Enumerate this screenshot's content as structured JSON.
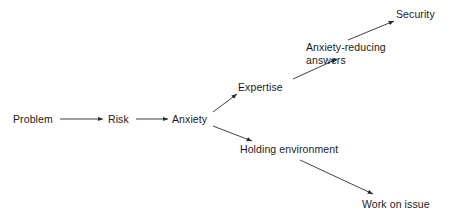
{
  "diagram": {
    "type": "flowchart",
    "canvas": {
      "width": 453,
      "height": 219
    },
    "stroke_color": "#2b2b2b",
    "text_color": "#1a1a1a",
    "background_color": "#ffffff",
    "nodes": [
      {
        "id": "problem",
        "label": "Problem",
        "x": 13,
        "y": 113
      },
      {
        "id": "risk",
        "label": "Risk",
        "x": 108,
        "y": 113
      },
      {
        "id": "anxiety",
        "label": "Anxiety",
        "x": 172,
        "y": 113
      },
      {
        "id": "expertise",
        "label": "Expertise",
        "x": 238,
        "y": 81
      },
      {
        "id": "anxiety-reducing-answers",
        "label": "Anxiety-reducing\nanswers",
        "x": 306,
        "y": 41
      },
      {
        "id": "security",
        "label": "Security",
        "x": 396,
        "y": 8
      },
      {
        "id": "holding-environment",
        "label": "Holding environment",
        "x": 240,
        "y": 143
      },
      {
        "id": "work-on-issue",
        "label": "Work on issue",
        "x": 362,
        "y": 198
      }
    ],
    "edges": [
      {
        "id": "problem-to-risk",
        "from": "problem",
        "to": "risk",
        "x1": 60,
        "y1": 119,
        "x2": 103,
        "y2": 119
      },
      {
        "id": "risk-to-anxiety",
        "from": "risk",
        "to": "anxiety",
        "x1": 136,
        "y1": 119,
        "x2": 168,
        "y2": 119
      },
      {
        "id": "anxiety-to-expertise",
        "from": "anxiety",
        "to": "expertise",
        "x1": 213,
        "y1": 112,
        "x2": 237,
        "y2": 94
      },
      {
        "id": "expertise-to-answers",
        "from": "expertise",
        "to": "anxiety-reducing-answers",
        "x1": 293,
        "y1": 79,
        "x2": 337,
        "y2": 59
      },
      {
        "id": "answers-to-security",
        "from": "anxiety-reducing-answers",
        "to": "security",
        "x1": 348,
        "y1": 40,
        "x2": 394,
        "y2": 21
      },
      {
        "id": "anxiety-to-holding",
        "from": "anxiety",
        "to": "holding-environment",
        "x1": 213,
        "y1": 126,
        "x2": 252,
        "y2": 141
      },
      {
        "id": "holding-to-work",
        "from": "holding-environment",
        "to": "work-on-issue",
        "x1": 300,
        "y1": 160,
        "x2": 373,
        "y2": 194
      }
    ]
  }
}
